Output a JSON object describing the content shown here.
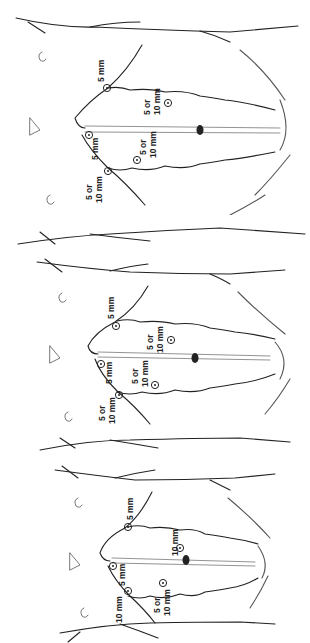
{
  "diagram": {
    "panels": [
      {
        "id": "panel-1",
        "ports": [
          {
            "label_line1": "5 mm",
            "label_line2": "",
            "position": "right-subcostal"
          },
          {
            "label_line1": "5 or",
            "label_line2": "10 mm",
            "position": "right-mid-abdomen"
          },
          {
            "label_line1": "5 mm",
            "label_line2": "",
            "position": "subxiphoid"
          },
          {
            "label_line1": "5 or",
            "label_line2": "10 mm",
            "position": "left-upper-abdomen"
          },
          {
            "label_line1": "5 or",
            "label_line2": "10 mm",
            "position": "left-subcostal"
          }
        ]
      },
      {
        "id": "panel-2",
        "ports": [
          {
            "label_line1": "5 mm",
            "label_line2": "",
            "position": "right-subcostal"
          },
          {
            "label_line1": "5 or",
            "label_line2": "10 mm",
            "position": "right-mid-abdomen"
          },
          {
            "label_line1": "5 mm",
            "label_line2": "",
            "position": "subxiphoid"
          },
          {
            "label_line1": "5 or",
            "label_line2": "10 mm",
            "position": "left-upper-abdomen"
          },
          {
            "label_line1": "5 or",
            "label_line2": "10 mm",
            "position": "left-subcostal"
          }
        ]
      },
      {
        "id": "panel-3",
        "ports": [
          {
            "label_line1": "5 mm",
            "label_line2": "",
            "position": "right-subcostal"
          },
          {
            "label_line1": "10 mm",
            "label_line2": "",
            "position": "periumbilical"
          },
          {
            "label_line1": "5 mm",
            "label_line2": "",
            "position": "subxiphoid"
          },
          {
            "label_line1": "5 or",
            "label_line2": "10 mm",
            "position": "left-upper-abdomen"
          },
          {
            "label_line1": "10 mm",
            "label_line2": "",
            "position": "left-subcostal"
          }
        ]
      }
    ],
    "colors": {
      "line": "#222222",
      "background": "#ffffff"
    }
  }
}
